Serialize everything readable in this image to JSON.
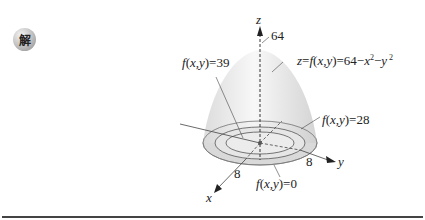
{
  "badge": {
    "label": "解"
  },
  "figure": {
    "z_axis_label": "z",
    "x_axis_label": "x",
    "y_axis_label": "y",
    "z_max": "64",
    "x_tick": "8",
    "y_tick": "8",
    "surface_label": "z=f(x,y)=64−x²−y ²",
    "level_39": "f(x,y)=39",
    "level_28": "f(x,y)=28",
    "level_0": "f(x,y)=0"
  }
}
